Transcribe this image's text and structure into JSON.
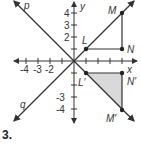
{
  "problem_number": "3.",
  "axes": {
    "x_label": "x",
    "y_label": "y",
    "x_ticks": [
      "-4",
      "-3",
      "-2"
    ],
    "y_ticks_pos": [
      "4",
      "3",
      "2"
    ],
    "y_ticks_neg": [
      "-3",
      "-4"
    ]
  },
  "lines": {
    "p": "p",
    "q": "q"
  },
  "points": {
    "L": {
      "label": "L",
      "x": 1,
      "y": 1
    },
    "M": {
      "label": "M",
      "x": 4,
      "y": 4
    },
    "N": {
      "label": "N",
      "x": 4,
      "y": 1
    },
    "L_prime": {
      "label": "L′",
      "x": 1,
      "y": -1
    },
    "M_prime": {
      "label": "M′",
      "x": 4,
      "y": -4
    },
    "N_prime": {
      "label": "N′",
      "x": 4,
      "y": -1
    }
  },
  "colors": {
    "line": "#333333",
    "fill": "#d9d9d9"
  }
}
